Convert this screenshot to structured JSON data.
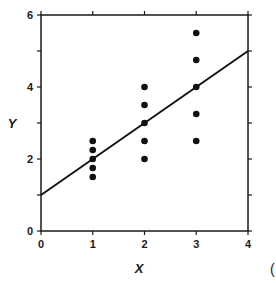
{
  "chart_data": {
    "type": "scatter",
    "title": "",
    "xlabel": "X",
    "ylabel": "Y",
    "xlim": [
      0,
      4
    ],
    "ylim": [
      0,
      6
    ],
    "x_ticks": [
      0,
      1,
      2,
      3,
      4
    ],
    "y_ticks": [
      0,
      2,
      4,
      6
    ],
    "y_minor_ticks": [
      1,
      3,
      5
    ],
    "grid": false,
    "legend": null,
    "series": [
      {
        "name": "observations",
        "style": "points",
        "color": "#111111",
        "points": [
          {
            "x": 1,
            "y": 2.5
          },
          {
            "x": 1,
            "y": 2.25
          },
          {
            "x": 1,
            "y": 2.0
          },
          {
            "x": 1,
            "y": 1.75
          },
          {
            "x": 1,
            "y": 1.5
          },
          {
            "x": 2,
            "y": 4.0
          },
          {
            "x": 2,
            "y": 3.5
          },
          {
            "x": 2,
            "y": 3.0
          },
          {
            "x": 2,
            "y": 2.5
          },
          {
            "x": 2,
            "y": 2.0
          },
          {
            "x": 3,
            "y": 5.5
          },
          {
            "x": 3,
            "y": 4.75
          },
          {
            "x": 3,
            "y": 4.0
          },
          {
            "x": 3,
            "y": 3.25
          },
          {
            "x": 3,
            "y": 2.5
          }
        ]
      },
      {
        "name": "regression line",
        "style": "line",
        "color": "#111111",
        "intercept": 1,
        "slope": 1,
        "points": [
          {
            "x": 0,
            "y": 1
          },
          {
            "x": 4,
            "y": 5
          }
        ]
      }
    ],
    "annotations": [
      "("
    ]
  },
  "labels": {
    "x_axis": "X",
    "y_axis": "Y",
    "panel_mark": "(",
    "x_tick_labels": [
      "0",
      "1",
      "2",
      "3",
      "4"
    ],
    "y_tick_labels": [
      "0",
      "2",
      "4",
      "6"
    ]
  }
}
